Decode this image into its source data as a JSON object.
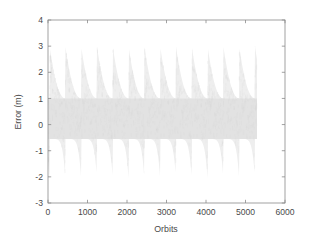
{
  "figure": {
    "background_color": "#ffffff",
    "axes_color": "#7f7f7f",
    "text_color": "#4a4a4a"
  },
  "chart_data": {
    "type": "scatter",
    "title": "",
    "subtitle": "",
    "xlabel": "Orbits",
    "ylabel": "Error (m)",
    "xlim": [
      0,
      6000
    ],
    "ylim": [
      -3,
      4
    ],
    "xticks": [
      0,
      1000,
      2000,
      3000,
      4000,
      5000,
      6000
    ],
    "xtick_labels": [
      "0",
      "1000",
      "2000",
      "3000",
      "4000",
      "5000",
      "6000"
    ],
    "yticks": [
      -3,
      -2,
      -1,
      0,
      1,
      2,
      3,
      4
    ],
    "ytick_labels": [
      "-3",
      "-2",
      "-1",
      "0",
      "1",
      "2",
      "3",
      "4"
    ],
    "grid": false,
    "legend": null,
    "annotations": [],
    "series": [
      {
        "name": "Error",
        "marker": "dot",
        "color": "#e2e2e2",
        "point_color_light": "#eeeeee",
        "x_start": 0,
        "x_end": 5300,
        "description": "Dense scatter band of error samples versus orbit number; sawtooth envelope with periodic upward spikes to about +3 m and downward spikes to about -2 m, core band concentrated between -0.5 m and +1 m.",
        "envelope_period_orbits": 400,
        "envelope_peak_count": 13,
        "envelope_upper_peak": 3.0,
        "envelope_upper_base": 1.0,
        "envelope_lower_trough": -2.1,
        "envelope_lower_base": -0.55,
        "core_upper": 1.0,
        "core_lower": -0.55,
        "peak_orbits": [
          40,
          600,
          980,
          1340,
          1720,
          2090,
          2470,
          2840,
          3230,
          3610,
          3990,
          4370,
          4760,
          5140
        ],
        "trough_orbits": [
          620,
          1000,
          1360,
          1740,
          2110,
          2490,
          2860,
          3250,
          3630,
          4010,
          4390,
          4780,
          5160
        ]
      }
    ]
  }
}
